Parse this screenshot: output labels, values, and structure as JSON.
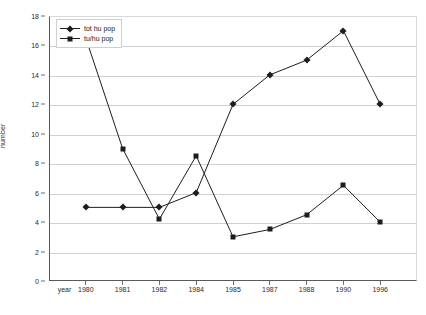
{
  "chart_data": {
    "type": "line",
    "title": "",
    "xlabel": "year",
    "ylabel": "number",
    "ylim": [
      0,
      18
    ],
    "ytick_step": 2,
    "grid": true,
    "legend_position": "top-left",
    "categories": [
      "1980",
      "1981",
      "1982",
      "1984",
      "1985",
      "1987",
      "1988",
      "1990",
      "1996"
    ],
    "yticks": [
      "0",
      "2",
      "4",
      "6",
      "8",
      "10",
      "12",
      "14",
      "16",
      "18"
    ],
    "series": [
      {
        "name": "tot hu pop",
        "marker": "diamond",
        "color": "#1d1d1d",
        "values": [
          5,
          5,
          5,
          6,
          12,
          14,
          15,
          17,
          12
        ]
      },
      {
        "name": "tu/hu pop",
        "marker": "square",
        "color": "#1d1d1d",
        "values": [
          16.5,
          9,
          4.2,
          8.5,
          3,
          3.5,
          4.5,
          6.5,
          4
        ]
      }
    ]
  },
  "axis": {
    "x_axis_caption": "year"
  }
}
